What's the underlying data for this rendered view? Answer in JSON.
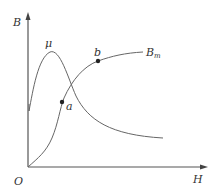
{
  "diagram": {
    "title": "",
    "axes": {
      "y_label": "B",
      "x_label": "H",
      "origin_label": "O"
    },
    "curves": [
      {
        "id": "mu",
        "label": "μ",
        "description": "permeability curve: rises steeply to a peak, then decays"
      },
      {
        "id": "B",
        "label_main": "B",
        "label_sub": "m",
        "description": "magnetization curve B-H: starts at origin, rises and saturates"
      }
    ],
    "points": [
      {
        "id": "a",
        "label": "a"
      },
      {
        "id": "b",
        "label": "b"
      }
    ],
    "colors": {
      "axis": "#555555",
      "curve": "#666666",
      "point": "#222222",
      "text": "#333333"
    }
  }
}
